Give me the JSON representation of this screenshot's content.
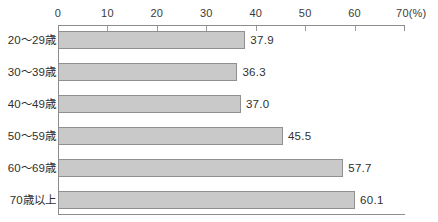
{
  "chart_data": {
    "type": "bar",
    "orientation": "horizontal",
    "title": "",
    "xlabel": "",
    "ylabel": "",
    "unit": "(%)",
    "xlim": [
      0,
      70
    ],
    "xticks": [
      0,
      10,
      20,
      30,
      40,
      50,
      60,
      70
    ],
    "xtick_labels": [
      "0",
      "10",
      "20",
      "30",
      "40",
      "50",
      "60",
      "70"
    ],
    "grid": false,
    "legend": false,
    "categories": [
      "20～29歳",
      "30～39歳",
      "40～49歳",
      "50～59歳",
      "60～69歳",
      "70歳以上"
    ],
    "values": [
      37.9,
      36.3,
      37.0,
      45.5,
      57.7,
      60.1
    ],
    "value_labels": [
      "37.9",
      "36.3",
      "37.0",
      "45.5",
      "57.7",
      "60.1"
    ],
    "bar_fill_color": "#c9c9c9",
    "bar_border_color": "#8f8f8f",
    "axis_color": "#8c8c8c",
    "text_color": "#2f2f2f",
    "background_color": "#ffffff"
  }
}
